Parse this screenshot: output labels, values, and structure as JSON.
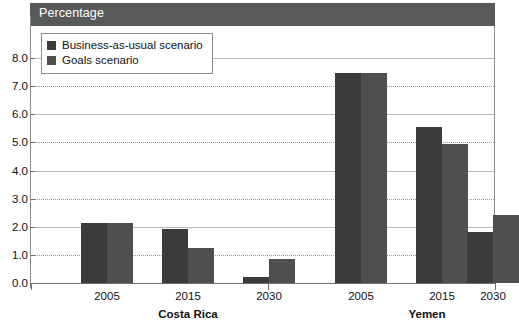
{
  "header": {
    "title": "Percentage"
  },
  "legend": {
    "position": "top-left-inside",
    "items": [
      {
        "label": "Business-as-usual scenario",
        "color": "#3b3b3b",
        "key": "bau"
      },
      {
        "label": "Goals scenario",
        "color": "#4f4f4f",
        "key": "goals"
      }
    ]
  },
  "axis": {
    "y_ticks": [
      "0.0",
      "1.0",
      "2.0",
      "3.0",
      "4.0",
      "5.0",
      "6.0",
      "7.0",
      "8.0"
    ],
    "x_groups": [
      {
        "country": "Costa Rica",
        "years": [
          "2005",
          "2015",
          "2030"
        ]
      },
      {
        "country": "Yemen",
        "years": [
          "2005",
          "2015",
          "2030"
        ]
      }
    ]
  },
  "chart_data": {
    "type": "bar",
    "title": "Percentage",
    "xlabel": "",
    "ylabel": "Percentage",
    "ylim": [
      0.0,
      8.0
    ],
    "ytick_step": 1.0,
    "grid": true,
    "legend_position": "top-left-inside",
    "categories": [
      "Costa Rica 2005",
      "Costa Rica 2015",
      "Costa Rica 2030",
      "Yemen 2005",
      "Yemen 2015",
      "Yemen 2030"
    ],
    "groups": [
      {
        "country": "Costa Rica",
        "years": [
          "2005",
          "2015",
          "2030"
        ]
      },
      {
        "country": "Yemen",
        "years": [
          "2005",
          "2015",
          "2030"
        ]
      }
    ],
    "series": [
      {
        "name": "Business-as-usual scenario",
        "color": "#3b3b3b",
        "values": [
          2.15,
          1.93,
          0.22,
          7.47,
          5.55,
          1.83
        ]
      },
      {
        "name": "Goals scenario",
        "color": "#4f4f4f",
        "values": [
          2.15,
          1.26,
          0.85,
          7.47,
          4.93,
          2.42
        ]
      }
    ]
  },
  "colors": {
    "header_band": "#58595b",
    "bau": "#3b3b3b",
    "goals": "#4f4f4f",
    "frame": "#8d8d8d",
    "gridline": "#9a9a9a"
  }
}
